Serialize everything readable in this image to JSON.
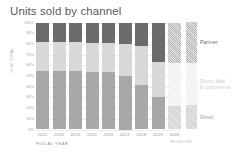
{
  "chart_data": {
    "type": "bar",
    "subtype": "100% stacked bar",
    "title": "Units sold by channel",
    "xlabel": "FISCAL YEAR",
    "ylabel": "% OF TOTAL",
    "categories": [
      "2012",
      "2013",
      "2014",
      "2015",
      "2016",
      "2017",
      "2018",
      "2019",
      "2020"
    ],
    "ylim": [
      0,
      100
    ],
    "yticks": [
      0,
      10,
      20,
      30,
      40,
      50,
      60,
      70,
      80,
      90,
      100
    ],
    "ytick_labels": [
      "0%",
      "10%",
      "20%",
      "30%",
      "40%",
      "50%",
      "60%",
      "70%",
      "80%",
      "90%",
      "100%"
    ],
    "grid": true,
    "legend_position": "right",
    "stack_order_bottom_to_top": [
      "Retail",
      "Direct Mail / E-commerce",
      "Partner"
    ],
    "series": [
      {
        "name": "Retail",
        "color": "#a8a8aa",
        "values": [
          55,
          55,
          55,
          54,
          54,
          50,
          42,
          30,
          22
        ]
      },
      {
        "name": "Direct Mail / E-commerce",
        "color": "#d8d8da",
        "values": [
          27,
          27,
          27,
          27,
          27,
          30,
          36,
          33,
          40
        ]
      },
      {
        "name": "Partner",
        "color": "#6b6b6d",
        "values": [
          18,
          18,
          18,
          19,
          19,
          20,
          22,
          37,
          38
        ]
      }
    ],
    "annotations": [
      {
        "category": "2020",
        "text": "PROJECTED",
        "style": "hatched-bar"
      }
    ]
  },
  "legend": {
    "entries": [
      {
        "label": "Partner",
        "color": "#6b6b6d"
      },
      {
        "label": "Direct Mail\nE-commerce",
        "label_line1": "Direct Mail",
        "label_line2": "E-commerce",
        "color": "#d8d8da"
      },
      {
        "label": "Retail",
        "color": "#a8a8aa"
      }
    ]
  },
  "axis": {
    "x_title": "FISCAL YEAR",
    "y_title": "% OF TOTAL",
    "projected_note": "PROJECTED"
  }
}
